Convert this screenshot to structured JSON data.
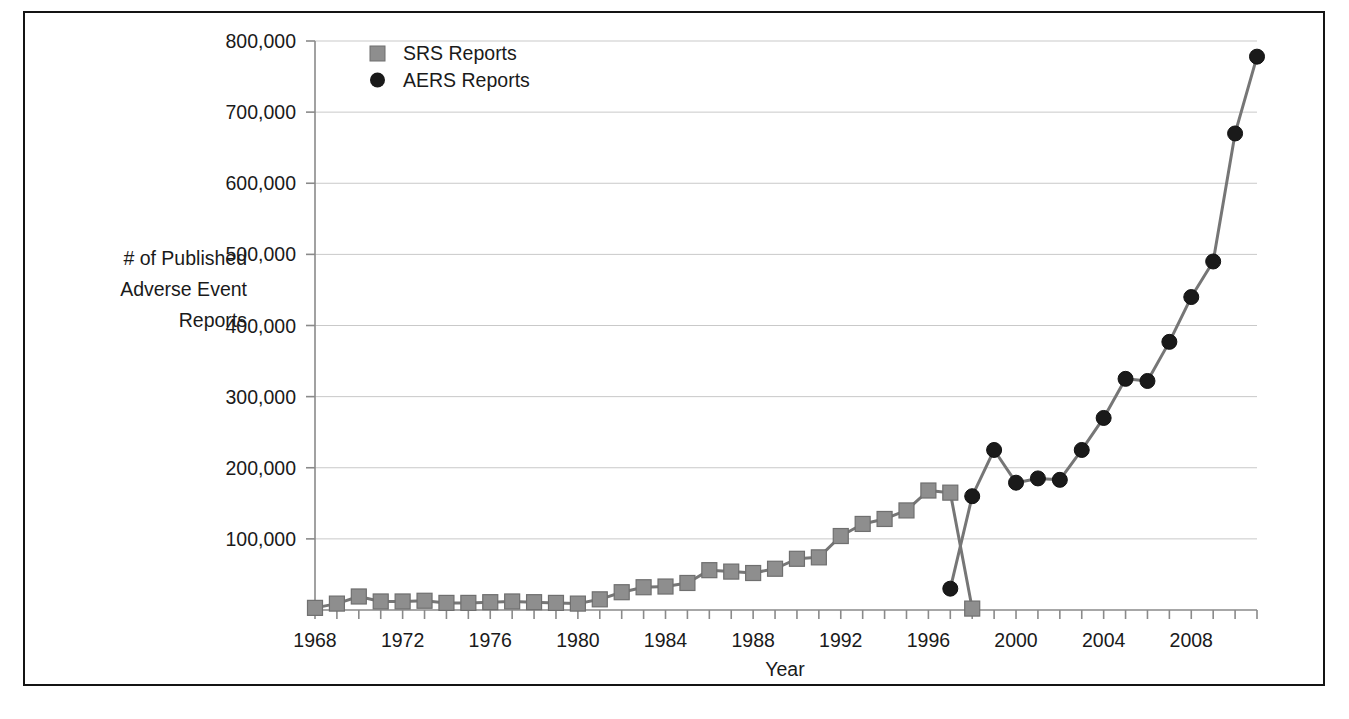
{
  "figure": {
    "frame_color": "#141414",
    "background": "#ffffff"
  },
  "chart_data": {
    "type": "line",
    "title": "",
    "xlabel": "Year",
    "ylabel": "# of Published Adverse Event Reports",
    "ylabel_lines": [
      "# of Published",
      "Adverse Event",
      "Reports"
    ],
    "grid": true,
    "grid_axis": "y",
    "legend_position": "top-left-inside",
    "xlim": [
      1968,
      2011
    ],
    "ylim": [
      0,
      800000
    ],
    "ytick_labels": [
      "800,000",
      "700,000",
      "600,000",
      "500,000",
      "400,000",
      "300,000",
      "200,000",
      "100,000"
    ],
    "yticks": [
      800000,
      700000,
      600000,
      500000,
      400000,
      300000,
      200000,
      100000
    ],
    "xtick_labels": [
      "1968",
      "1972",
      "1976",
      "1980",
      "1984",
      "1988",
      "1992",
      "1996",
      "2000",
      "2004",
      "2008"
    ],
    "xticks": [
      1968,
      1972,
      1976,
      1980,
      1984,
      1988,
      1992,
      1996,
      2000,
      2004,
      2008
    ],
    "x_minor_tick_step": 1,
    "series": [
      {
        "name": "SRS Reports",
        "marker": "square",
        "marker_color": "#8e8e8e",
        "marker_edge_color": "#6f6f6f",
        "line_color": "#767676",
        "x": [
          1968,
          1969,
          1970,
          1971,
          1972,
          1973,
          1974,
          1975,
          1976,
          1977,
          1978,
          1979,
          1980,
          1981,
          1982,
          1983,
          1984,
          1985,
          1986,
          1987,
          1988,
          1989,
          1990,
          1991,
          1992,
          1993,
          1994,
          1995,
          1996,
          1997,
          1998
        ],
        "values": [
          3000,
          9000,
          19000,
          12000,
          12000,
          13000,
          10000,
          10000,
          11000,
          12000,
          11000,
          10000,
          9000,
          15000,
          25000,
          32000,
          33000,
          38000,
          56000,
          54000,
          52000,
          58000,
          72000,
          74000,
          104000,
          121000,
          128000,
          140000,
          168000,
          165000,
          2000
        ]
      },
      {
        "name": "AERS Reports",
        "marker": "circle",
        "marker_color": "#1a1a1a",
        "marker_edge_color": "#111111",
        "line_color": "#767676",
        "x": [
          1997,
          1998,
          1999,
          2000,
          2001,
          2002,
          2003,
          2004,
          2005,
          2006,
          2007,
          2008,
          2009,
          2010,
          2011
        ],
        "values": [
          30000,
          160000,
          225000,
          179000,
          185000,
          183000,
          225000,
          270000,
          325000,
          322000,
          377000,
          440000,
          490000,
          670000,
          778000
        ]
      }
    ]
  },
  "legend": {
    "items": [
      {
        "label": "SRS Reports",
        "marker": "square",
        "color": "#8e8e8e"
      },
      {
        "label": "AERS Reports",
        "marker": "circle",
        "color": "#1a1a1a"
      }
    ]
  }
}
